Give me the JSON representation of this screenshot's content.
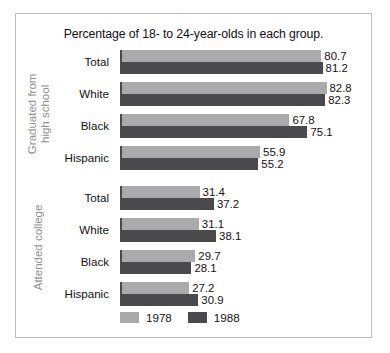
{
  "chart_data": {
    "type": "bar",
    "orientation": "horizontal",
    "title": "Percentage of 18- to 24-year-olds in each group.",
    "xlabel": "",
    "ylabel": "",
    "xlim": [
      0,
      100
    ],
    "grid": false,
    "legend_position": "bottom",
    "categories": [
      "Total",
      "White",
      "Black",
      "Hispanic"
    ],
    "series": [
      {
        "name": "1978",
        "color": "#aaaaac"
      },
      {
        "name": "1988",
        "color": "#4a4a4c"
      }
    ],
    "panels": [
      {
        "label": "Graduated from high school",
        "label_line1": "Graduated from",
        "label_line2": "high school",
        "categories": [
          "Total",
          "White",
          "Black",
          "Hispanic"
        ],
        "series": [
          {
            "name": "1978",
            "values": [
              80.7,
              82.8,
              67.8,
              55.9
            ]
          },
          {
            "name": "1988",
            "values": [
              81.2,
              82.3,
              75.1,
              55.2
            ]
          }
        ]
      },
      {
        "label": "Attended college",
        "label_line1": "Attended college",
        "label_line2": "",
        "categories": [
          "Total",
          "White",
          "Black",
          "Hispanic"
        ],
        "series": [
          {
            "name": "1978",
            "values": [
              31.4,
              31.1,
              29.7,
              27.2
            ]
          },
          {
            "name": "1988",
            "values": [
              37.2,
              38.1,
              28.1,
              30.9
            ]
          }
        ]
      }
    ]
  },
  "title": "Percentage of 18- to 24-year-olds in each group.",
  "panels": {
    "high_school": {
      "axis_label_line1": "Graduated from",
      "axis_label_line2": "high school",
      "rows": [
        {
          "category": "Total",
          "v1978": "80.7",
          "v1988": "81.2"
        },
        {
          "category": "White",
          "v1978": "82.8",
          "v1988": "82.3"
        },
        {
          "category": "Black",
          "v1978": "67.8",
          "v1988": "75.1"
        },
        {
          "category": "Hispanic",
          "v1978": "55.9",
          "v1988": "55.2"
        }
      ]
    },
    "college": {
      "axis_label_line1": "Attended college",
      "axis_label_line2": "",
      "rows": [
        {
          "category": "Total",
          "v1978": "31.4",
          "v1988": "37.2"
        },
        {
          "category": "White",
          "v1978": "31.1",
          "v1988": "38.1"
        },
        {
          "category": "Black",
          "v1978": "29.7",
          "v1988": "28.1"
        },
        {
          "category": "Hispanic",
          "v1978": "27.2",
          "v1988": "30.9"
        }
      ]
    }
  },
  "legend": {
    "items": [
      {
        "label": "1978",
        "color": "#aaaaac"
      },
      {
        "label": "1988",
        "color": "#4a4a4c"
      }
    ]
  },
  "colors": {
    "series_1978": "#aaaaac",
    "series_1988": "#4a4a4c",
    "axis_line": "#4a4a4c",
    "frame": "#b9bcc0",
    "panel_label": "#8e9093",
    "text": "#111111",
    "background": "#ffffff"
  }
}
